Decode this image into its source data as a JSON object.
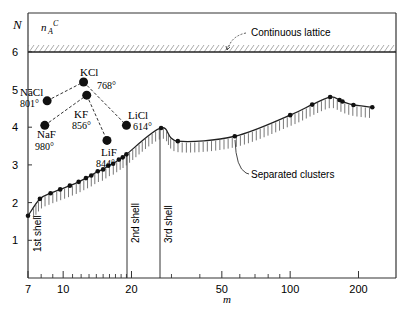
{
  "chart_data": {
    "type": "line",
    "title": "",
    "xlabel": "m",
    "ylabel": "N",
    "xscale": "log",
    "xlim": [
      7,
      260
    ],
    "ylim": [
      0,
      6.9
    ],
    "x_ticks": [
      7,
      10,
      20,
      50,
      100,
      200
    ],
    "y_ticks": [
      1,
      2,
      3,
      4,
      5,
      6
    ],
    "grid": false,
    "legend": null,
    "continuous_lattice": {
      "label": "Continuous lattice",
      "symbol": "n_A^C",
      "N": 6
    },
    "series": [
      {
        "name": "Separated clusters",
        "style": "line with hatching below and point markers",
        "x": [
          7,
          7.9,
          8.8,
          9.7,
          10.7,
          11.7,
          12.6,
          13.3,
          14.2,
          15.0,
          15.8,
          16.6,
          17.6,
          18.3,
          19.0,
          27,
          32,
          57,
          100,
          125,
          150,
          165,
          170,
          190,
          230
        ],
        "y": [
          1.65,
          2.1,
          2.25,
          2.35,
          2.45,
          2.55,
          2.65,
          2.72,
          2.83,
          2.88,
          2.98,
          3.03,
          3.14,
          3.2,
          3.28,
          3.98,
          3.63,
          3.76,
          4.32,
          4.6,
          4.8,
          4.72,
          4.68,
          4.59,
          4.53
        ]
      },
      {
        "name": "Alkali halide molecules",
        "style": "large dots connected by dashed lines",
        "points": [
          {
            "label": "NaCl",
            "temp": "801°",
            "m": 8.5,
            "N": 4.7
          },
          {
            "label": "KCl",
            "temp": "768°",
            "m": 12.3,
            "N": 5.2
          },
          {
            "label": "KF",
            "temp": "856°",
            "m": 12.7,
            "N": 4.85
          },
          {
            "label": "NaF",
            "temp": "980°",
            "m": 8.3,
            "N": 4.05
          },
          {
            "label": "LiF",
            "temp": "844°",
            "m": 15.6,
            "N": 3.65
          },
          {
            "label": "LiCl",
            "temp": "614°",
            "m": 19.0,
            "N": 4.05
          }
        ],
        "dashed_links": [
          [
            "NaCl",
            "KCl"
          ],
          [
            "KCl",
            "LiCl"
          ],
          [
            "NaF",
            "KF"
          ],
          [
            "KF",
            "LiF"
          ]
        ]
      }
    ],
    "annotations": [
      {
        "text": "Continuous lattice",
        "arrow_to": "hatched band at N=6"
      },
      {
        "text": "Separated clusters",
        "arrow_to": "curve near m≈40"
      },
      {
        "text": "1st shell",
        "m": 7,
        "orientation": "vertical"
      },
      {
        "text": "2nd shell",
        "m": 19,
        "orientation": "vertical"
      },
      {
        "text": "3rd shell",
        "m": 27,
        "orientation": "vertical"
      }
    ]
  },
  "labels": {
    "y_axis": "N",
    "x_axis": "m",
    "lattice_symbol": "n",
    "lattice_sub": "A",
    "lattice_sup": "C",
    "continuous_lattice": "Continuous lattice",
    "separated_clusters": "Separated clusters",
    "shell1": "1st shell",
    "shell2": "2nd shell",
    "shell3": "3rd shell",
    "x_ticks": [
      "7",
      "10",
      "20",
      "50",
      "100",
      "200"
    ],
    "y_ticks": [
      "1",
      "2",
      "3",
      "4",
      "5",
      "6"
    ],
    "salts": [
      {
        "name": "NaCl",
        "temp": "801°"
      },
      {
        "name": "KCl",
        "temp": "768°"
      },
      {
        "name": "KF",
        "temp": "856°"
      },
      {
        "name": "NaF",
        "temp": "980°"
      },
      {
        "name": "LiF",
        "temp": "844°"
      },
      {
        "name": "LiCl",
        "temp": "614°"
      }
    ]
  }
}
